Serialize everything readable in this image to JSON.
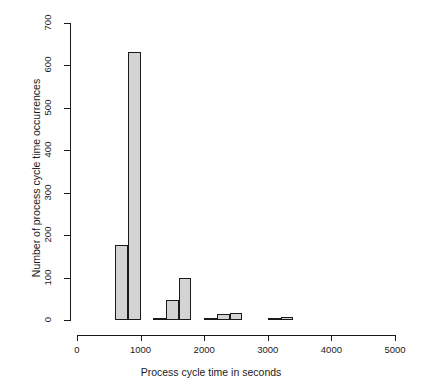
{
  "chart_data": {
    "type": "bar",
    "title": "",
    "xlabel": "Process cycle time in seconds",
    "ylabel": "Number of process cycle time occurrences",
    "xlim": [
      0,
      5000
    ],
    "ylim": [
      0,
      700
    ],
    "grid": false,
    "legend": null,
    "bin_width": 200,
    "xticks": [
      {
        "value": 0,
        "label": "0"
      },
      {
        "value": 1000,
        "label": "1000"
      },
      {
        "value": 2000,
        "label": "2000"
      },
      {
        "value": 3000,
        "label": "3000"
      },
      {
        "value": 4000,
        "label": "4000"
      },
      {
        "value": 5000,
        "label": "5000"
      }
    ],
    "yticks": [
      {
        "value": 0,
        "label": "0"
      },
      {
        "value": 100,
        "label": "100"
      },
      {
        "value": 200,
        "label": "200"
      },
      {
        "value": 300,
        "label": "300"
      },
      {
        "value": 400,
        "label": "400"
      },
      {
        "value": 500,
        "label": "500"
      },
      {
        "value": 600,
        "label": "600"
      },
      {
        "value": 700,
        "label": "700"
      }
    ],
    "bins": [
      {
        "x0": 600,
        "x1": 800,
        "value": 177
      },
      {
        "x0": 800,
        "x1": 1000,
        "value": 632
      },
      {
        "x0": 1200,
        "x1": 1400,
        "value": 5
      },
      {
        "x0": 1400,
        "x1": 1600,
        "value": 48
      },
      {
        "x0": 1600,
        "x1": 1800,
        "value": 100
      },
      {
        "x0": 2000,
        "x1": 2200,
        "value": 4
      },
      {
        "x0": 2200,
        "x1": 2400,
        "value": 15
      },
      {
        "x0": 2400,
        "x1": 2600,
        "value": 17
      },
      {
        "x0": 3000,
        "x1": 3200,
        "value": 4
      },
      {
        "x0": 3200,
        "x1": 3400,
        "value": 7
      }
    ],
    "categories": [
      "600-800",
      "800-1000",
      "1200-1400",
      "1400-1600",
      "1600-1800",
      "2000-2200",
      "2200-2400",
      "2400-2600",
      "3000-3200",
      "3200-3400"
    ],
    "values": [
      177,
      632,
      5,
      48,
      100,
      4,
      15,
      17,
      4,
      7
    ],
    "colors": {
      "bar_fill": "#d4d4d4",
      "bar_border": "#1a1a1a",
      "axis": "#1a1a1a",
      "background": "#ffffff"
    }
  }
}
